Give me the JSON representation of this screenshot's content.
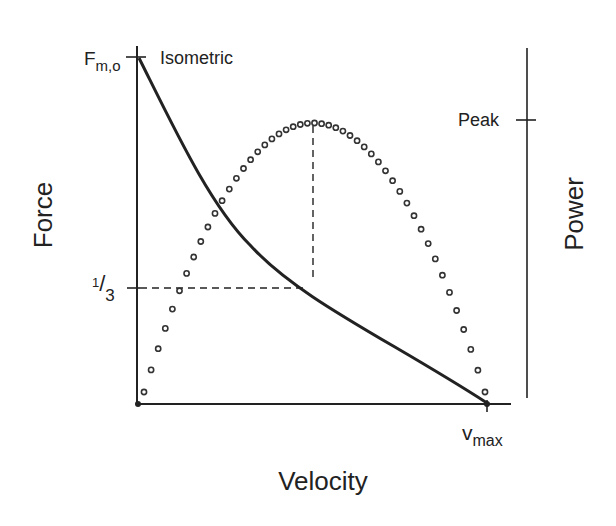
{
  "chart_data": {
    "type": "line",
    "title": "",
    "xlabel": "Velocity",
    "ylabel_left": "Force",
    "ylabel_right": "Power",
    "x_ticks": [
      "0",
      "vmax"
    ],
    "y_left_ticks": [
      "Fm,o",
      "1/3"
    ],
    "y_right_ticks": [
      "Peak"
    ],
    "annotations": [
      "Isometric"
    ],
    "xlim": [
      0,
      1
    ],
    "ylim": [
      0,
      1
    ],
    "grid": false,
    "series": [
      {
        "name": "Force",
        "style": "solid",
        "x": [
          0,
          0.1,
          0.2,
          0.3,
          0.4,
          0.5,
          0.6,
          0.7,
          0.8,
          0.9,
          1.0
        ],
        "y": [
          1.0,
          0.73,
          0.56,
          0.43,
          0.33,
          0.25,
          0.18,
          0.12,
          0.07,
          0.03,
          0.0
        ]
      },
      {
        "name": "Power",
        "style": "dotted",
        "x": [
          0,
          0.1,
          0.2,
          0.3,
          0.4,
          0.5,
          0.6,
          0.7,
          0.8,
          0.9,
          1.0
        ],
        "y": [
          0.0,
          0.33,
          0.63,
          0.86,
          0.99,
          1.0,
          0.93,
          0.79,
          0.57,
          0.29,
          0.0
        ]
      }
    ],
    "reference_lines": [
      {
        "type": "vertical",
        "x": 0.5,
        "from": "x-axis",
        "to": "power peak",
        "style": "dashed"
      },
      {
        "type": "horizontal",
        "y": "1/3 Fm,o",
        "from": "y-axis",
        "to": "force curve",
        "style": "dashed"
      }
    ]
  },
  "labels": {
    "force_axis": "Force",
    "power_axis": "Power",
    "velocity_axis": "Velocity",
    "fmo_main": "F",
    "fmo_sub": "m,o",
    "isometric": "Isometric",
    "peak": "Peak",
    "third_num": "1",
    "third_den": "3",
    "vmax_main": "v",
    "vmax_sub": "max"
  }
}
